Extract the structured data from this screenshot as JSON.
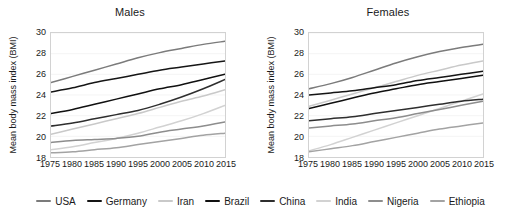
{
  "axis": {
    "ylabel": "Mean body mass index (BMI)",
    "yticks": [
      "18",
      "20",
      "22",
      "24",
      "26",
      "28",
      "30"
    ],
    "xticks": [
      "1975",
      "1980",
      "1985",
      "1990",
      "1995",
      "2000",
      "2005",
      "2010",
      "2015"
    ]
  },
  "panels": {
    "males": {
      "title": "Males"
    },
    "females": {
      "title": "Females"
    }
  },
  "legend": {
    "items": [
      {
        "label": "USA",
        "color": "#7b7b7b"
      },
      {
        "label": "Germany",
        "color": "#151515"
      },
      {
        "label": "Iran",
        "color": "#c9c9c9"
      },
      {
        "label": "Brazil",
        "color": "#101010"
      },
      {
        "label": "China",
        "color": "#2e2e2e"
      },
      {
        "label": "India",
        "color": "#d2d2d2"
      },
      {
        "label": "Nigeria",
        "color": "#8d8d8d"
      },
      {
        "label": "Ethiopia",
        "color": "#a3a3a3"
      }
    ]
  },
  "chart_data": [
    {
      "type": "line",
      "title": "Males",
      "xlabel": "",
      "ylabel": "Mean body mass index (BMI)",
      "x": [
        1975,
        1980,
        1985,
        1990,
        1995,
        2000,
        2005,
        2010,
        2015
      ],
      "xlim": [
        1975,
        2015
      ],
      "ylim": [
        18,
        30
      ],
      "grid": true,
      "legend_position": "bottom",
      "series": [
        {
          "name": "USA",
          "color": "#7b7b7b",
          "values": [
            25.2,
            25.8,
            26.4,
            27.0,
            27.6,
            28.1,
            28.5,
            28.9,
            29.2
          ]
        },
        {
          "name": "Germany",
          "color": "#151515",
          "values": [
            24.3,
            24.7,
            25.2,
            25.6,
            26.0,
            26.4,
            26.7,
            27.0,
            27.3
          ]
        },
        {
          "name": "Brazil",
          "color": "#101010",
          "values": [
            22.2,
            22.6,
            23.1,
            23.6,
            24.1,
            24.6,
            25.0,
            25.5,
            26.0
          ]
        },
        {
          "name": "China",
          "color": "#2e2e2e",
          "values": [
            21.0,
            21.3,
            21.7,
            22.1,
            22.5,
            23.1,
            23.8,
            24.6,
            25.5
          ]
        },
        {
          "name": "Iran",
          "color": "#c9c9c9",
          "values": [
            20.2,
            20.7,
            21.2,
            21.7,
            22.2,
            22.8,
            23.4,
            23.9,
            24.5
          ]
        },
        {
          "name": "India",
          "color": "#d2d2d2",
          "values": [
            18.7,
            19.0,
            19.4,
            19.8,
            20.3,
            20.9,
            21.5,
            22.2,
            23.0
          ]
        },
        {
          "name": "Nigeria",
          "color": "#8d8d8d",
          "values": [
            19.4,
            19.6,
            19.7,
            19.8,
            20.0,
            20.4,
            20.7,
            21.0,
            21.4
          ]
        },
        {
          "name": "Ethiopia",
          "color": "#a3a3a3",
          "values": [
            18.4,
            18.5,
            18.7,
            18.9,
            19.2,
            19.5,
            19.8,
            20.1,
            20.3
          ]
        }
      ]
    },
    {
      "type": "line",
      "title": "Females",
      "xlabel": "",
      "ylabel": "Mean body mass index (BMI)",
      "x": [
        1975,
        1980,
        1985,
        1990,
        1995,
        2000,
        2005,
        2010,
        2015
      ],
      "xlim": [
        1975,
        2015
      ],
      "ylim": [
        18,
        30
      ],
      "grid": true,
      "legend_position": "bottom",
      "series": [
        {
          "name": "USA",
          "color": "#7b7b7b",
          "values": [
            24.6,
            25.1,
            25.7,
            26.4,
            27.1,
            27.7,
            28.2,
            28.6,
            28.9
          ]
        },
        {
          "name": "Iran",
          "color": "#c9c9c9",
          "values": [
            22.9,
            23.5,
            24.1,
            24.7,
            25.3,
            25.9,
            26.4,
            26.9,
            27.3
          ]
        },
        {
          "name": "Germany",
          "color": "#151515",
          "values": [
            24.0,
            24.2,
            24.4,
            24.7,
            25.0,
            25.4,
            25.7,
            26.0,
            26.3
          ]
        },
        {
          "name": "Brazil",
          "color": "#101010",
          "values": [
            22.7,
            23.2,
            23.7,
            24.2,
            24.6,
            25.0,
            25.3,
            25.6,
            25.9
          ]
        },
        {
          "name": "India",
          "color": "#d2d2d2",
          "values": [
            18.6,
            19.2,
            19.9,
            20.6,
            21.3,
            22.0,
            22.7,
            23.4,
            24.1
          ]
        },
        {
          "name": "China",
          "color": "#2e2e2e",
          "values": [
            21.5,
            21.7,
            21.9,
            22.2,
            22.5,
            22.8,
            23.1,
            23.4,
            23.6
          ]
        },
        {
          "name": "Nigeria",
          "color": "#8d8d8d",
          "values": [
            20.8,
            21.0,
            21.2,
            21.5,
            21.8,
            22.2,
            22.6,
            23.0,
            23.4
          ]
        },
        {
          "name": "Ethiopia",
          "color": "#a3a3a3",
          "values": [
            18.5,
            18.8,
            19.1,
            19.5,
            19.9,
            20.3,
            20.7,
            21.0,
            21.3
          ]
        }
      ]
    }
  ]
}
